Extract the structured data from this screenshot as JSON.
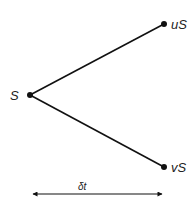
{
  "diagram": {
    "nodes": {
      "start": {
        "label": "S",
        "x": 30,
        "y": 95
      },
      "up": {
        "label": "uS",
        "x": 164,
        "y": 24
      },
      "down": {
        "label": "vS",
        "x": 164,
        "y": 167
      }
    },
    "time_arrow": {
      "label": "δt",
      "x1": 32,
      "x2": 163,
      "y": 194
    },
    "colors": {
      "line": "#111111",
      "text": "#222222",
      "background": "#ffffff"
    }
  }
}
